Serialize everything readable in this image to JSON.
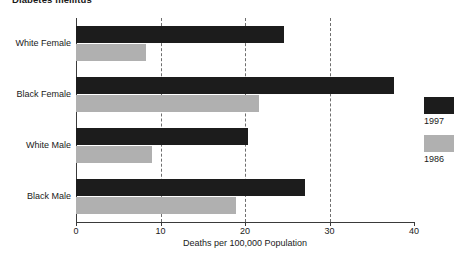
{
  "chart_data": {
    "type": "bar",
    "orientation": "horizontal",
    "title": "Diabetes mellitus",
    "xlabel": "Deaths per 100,000 Population",
    "ylabel": "",
    "categories": [
      "White Female",
      "Black Female",
      "White Male",
      "Black Male"
    ],
    "series": [
      {
        "name": "1997",
        "color": "#1c1c1c",
        "values": [
          24.6,
          37.6,
          20.4,
          27.1
        ]
      },
      {
        "name": "1986",
        "color": "#b0b0b0",
        "values": [
          8.3,
          21.7,
          9.0,
          18.9
        ]
      }
    ],
    "xlim": [
      0,
      40
    ],
    "xticks": [
      0,
      10,
      20,
      30,
      40
    ],
    "xtick_labels": [
      "0",
      "10",
      "20",
      "30",
      "40"
    ],
    "grid": true,
    "grid_style": "dashed-vertical",
    "legend_position": "right"
  },
  "legend": {
    "entries": [
      {
        "label": "1997",
        "color": "#1c1c1c"
      },
      {
        "label": "1986",
        "color": "#b0b0b0"
      }
    ]
  }
}
